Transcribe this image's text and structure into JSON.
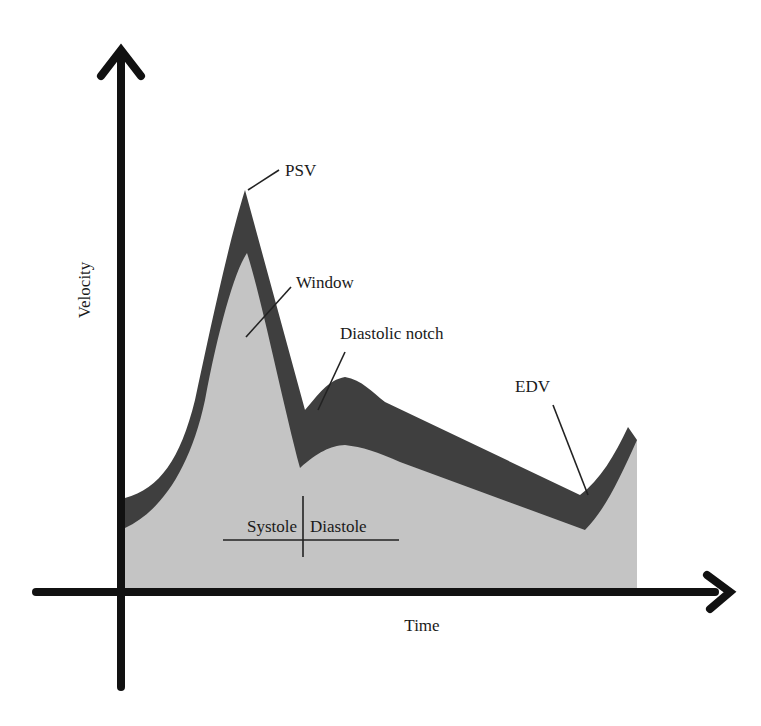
{
  "diagram": {
    "axes": {
      "y_label": "Velocity",
      "x_label": "Time"
    },
    "annotations": {
      "psv": "PSV",
      "window": "Window",
      "diastolic_notch": "Diastolic notch",
      "edv": "EDV",
      "systole": "Systole",
      "diastole": "Diastole"
    },
    "colors": {
      "spectral_envelope": "#3f3f3f",
      "window_fill": "#c4c4c4",
      "axis": "#111111",
      "background": "#ffffff"
    }
  }
}
